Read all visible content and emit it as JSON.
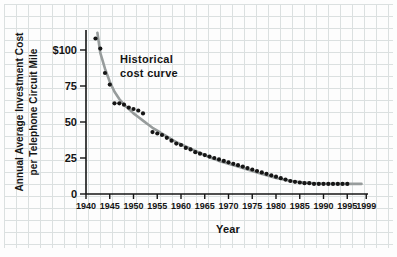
{
  "chart_data": {
    "type": "scatter",
    "title": "",
    "xlabel": "Year",
    "ylabel": "Annual Average Investment Cost per Telephone Circuit Mile",
    "ylabel_lines": [
      "Annual Average Investment Cost",
      "per Telephone Circuit Mile"
    ],
    "annotation_lines": [
      "Historical",
      "cost curve"
    ],
    "legend_position": "none",
    "grid": true,
    "xlim": [
      1940,
      2000
    ],
    "ylim": [
      0,
      115
    ],
    "x_ticks": [
      1940,
      1945,
      1950,
      1955,
      1960,
      1965,
      1970,
      1975,
      1980,
      1985,
      1990,
      1995,
      1999
    ],
    "y_ticks": [
      {
        "value": 100,
        "label": "$100"
      },
      {
        "value": 75,
        "label": "75"
      },
      {
        "value": 50,
        "label": "50"
      },
      {
        "value": 25,
        "label": "25"
      },
      {
        "value": 0,
        "label": "0"
      }
    ],
    "series": [
      {
        "name": "annual-data-points",
        "type": "scatter",
        "points": [
          [
            1942,
            108
          ],
          [
            1943,
            101
          ],
          [
            1944,
            84
          ],
          [
            1945,
            76
          ],
          [
            1946,
            63
          ],
          [
            1947,
            63
          ],
          [
            1948,
            62
          ],
          [
            1949,
            60
          ],
          [
            1950,
            59
          ],
          [
            1951,
            58
          ],
          [
            1952,
            56
          ],
          [
            1954,
            43
          ],
          [
            1955,
            42
          ],
          [
            1956,
            41
          ],
          [
            1957,
            39
          ],
          [
            1958,
            37
          ],
          [
            1959,
            35
          ],
          [
            1960,
            34
          ],
          [
            1961,
            32
          ],
          [
            1962,
            31
          ],
          [
            1963,
            29
          ],
          [
            1964,
            28
          ],
          [
            1965,
            27
          ],
          [
            1966,
            26
          ],
          [
            1967,
            25
          ],
          [
            1968,
            24
          ],
          [
            1969,
            23
          ],
          [
            1970,
            22
          ],
          [
            1971,
            21
          ],
          [
            1972,
            20
          ],
          [
            1973,
            19
          ],
          [
            1974,
            18
          ],
          [
            1975,
            17
          ],
          [
            1976,
            16
          ],
          [
            1977,
            15
          ],
          [
            1978,
            14
          ],
          [
            1979,
            13
          ],
          [
            1980,
            12
          ],
          [
            1981,
            11
          ],
          [
            1982,
            10
          ],
          [
            1983,
            9
          ],
          [
            1984,
            8.5
          ],
          [
            1985,
            8
          ],
          [
            1986,
            7.5
          ],
          [
            1987,
            7.5
          ],
          [
            1988,
            7
          ],
          [
            1989,
            7
          ],
          [
            1990,
            7
          ],
          [
            1991,
            7
          ],
          [
            1992,
            7
          ],
          [
            1993,
            7
          ],
          [
            1994,
            7
          ],
          [
            1995,
            7
          ]
        ]
      },
      {
        "name": "historical-cost-curve",
        "type": "line",
        "points": [
          [
            1942.4,
            112
          ],
          [
            1943,
            98
          ],
          [
            1944,
            87
          ],
          [
            1945,
            78
          ],
          [
            1946,
            71
          ],
          [
            1947,
            66
          ],
          [
            1948,
            62
          ],
          [
            1949,
            59
          ],
          [
            1950,
            56
          ],
          [
            1951,
            53.5
          ],
          [
            1952,
            51
          ],
          [
            1953,
            48.5
          ],
          [
            1954,
            46
          ],
          [
            1955,
            44
          ],
          [
            1956,
            42
          ],
          [
            1957,
            40
          ],
          [
            1958,
            38
          ],
          [
            1959,
            36
          ],
          [
            1960,
            34.5
          ],
          [
            1962,
            31.5
          ],
          [
            1964,
            28.5
          ],
          [
            1966,
            25.5
          ],
          [
            1968,
            23
          ],
          [
            1970,
            21
          ],
          [
            1972,
            19
          ],
          [
            1974,
            17
          ],
          [
            1976,
            15
          ],
          [
            1978,
            13
          ],
          [
            1980,
            11.2
          ],
          [
            1982,
            9.7
          ],
          [
            1984,
            8.6
          ],
          [
            1986,
            7.9
          ],
          [
            1988,
            7.4
          ],
          [
            1990,
            7.1
          ],
          [
            1992,
            7
          ],
          [
            1994,
            7
          ],
          [
            1996,
            7
          ],
          [
            1998,
            7
          ]
        ]
      }
    ],
    "colors": {
      "dot": "#151515",
      "curve": "#979c9c",
      "axis": "#141414",
      "grid": "#dbe0e0",
      "annotation": "#97999b",
      "background": "#fdfdfd"
    }
  }
}
